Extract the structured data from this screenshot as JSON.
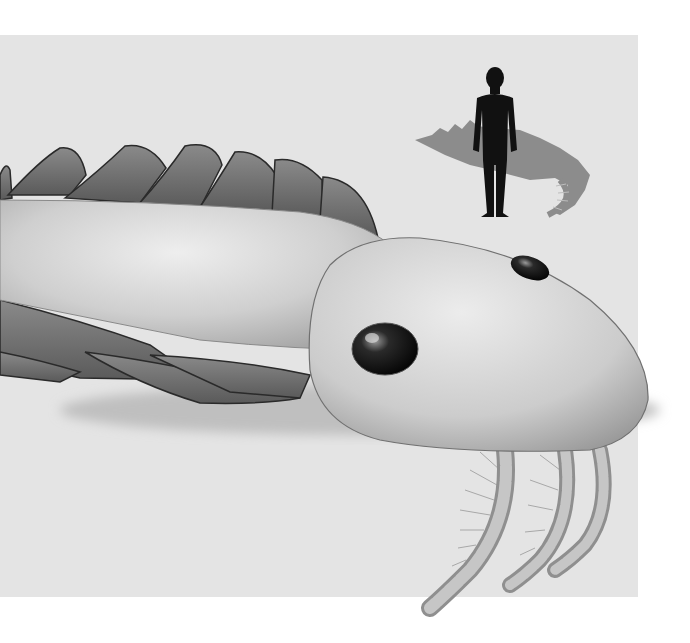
{
  "illustration": {
    "subject": "prehistoric-arthropod-anomalocaridid",
    "style": "grayscale",
    "scale_figure": "human-silhouette",
    "colors": {
      "page_background": "#ffffff",
      "panel_background": "#e4e4e4",
      "body_light": "#d6d6d6",
      "flap_dark": "#6a6a6a",
      "silhouette_human": "#111111",
      "silhouette_creature": "#8c8c8c",
      "eye": "#151515"
    }
  }
}
